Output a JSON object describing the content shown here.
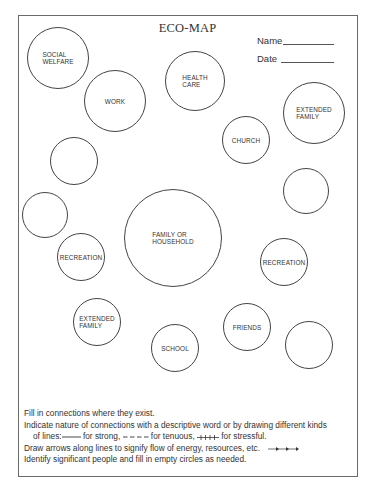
{
  "document": {
    "title": "ECO-MAP",
    "fields": {
      "name_label": "Name",
      "date_label": "Date"
    }
  },
  "circles": [
    {
      "id": "social-welfare",
      "label": "SOCIAL\nWELFARE",
      "cx": 58,
      "cy": 58,
      "r": 31
    },
    {
      "id": "work",
      "label": "WORK",
      "cx": 115,
      "cy": 101,
      "r": 31
    },
    {
      "id": "health-care",
      "label": "HEALTH\nCARE",
      "cx": 195,
      "cy": 81,
      "r": 30
    },
    {
      "id": "extended-family-top",
      "label": "EXTENDED\nFAMILY",
      "cx": 314,
      "cy": 113,
      "r": 31
    },
    {
      "id": "church",
      "label": "CHURCH",
      "cx": 246,
      "cy": 140,
      "r": 24
    },
    {
      "id": "empty-1",
      "label": "",
      "cx": 74,
      "cy": 161,
      "r": 24
    },
    {
      "id": "empty-2",
      "label": "",
      "cx": 306,
      "cy": 191,
      "r": 23
    },
    {
      "id": "empty-3",
      "label": "",
      "cx": 45,
      "cy": 215,
      "r": 23
    },
    {
      "id": "family-or-household",
      "label": "FAMILY OR\nHOUSEHOLD",
      "cx": 173,
      "cy": 238,
      "r": 49
    },
    {
      "id": "recreation-left",
      "label": "RECREATION",
      "cx": 81,
      "cy": 257,
      "r": 24
    },
    {
      "id": "recreation-right",
      "label": "RECREATION",
      "cx": 284,
      "cy": 262,
      "r": 24
    },
    {
      "id": "extended-family-bottom",
      "label": "EXTENDED\nFAMILY",
      "cx": 97,
      "cy": 322,
      "r": 24
    },
    {
      "id": "friends",
      "label": "FRIENDS",
      "cx": 247,
      "cy": 327,
      "r": 24
    },
    {
      "id": "school",
      "label": "SCHOOL",
      "cx": 175,
      "cy": 348,
      "r": 24
    },
    {
      "id": "empty-4",
      "label": "",
      "cx": 309,
      "cy": 345,
      "r": 24
    }
  ],
  "instructions": {
    "line1": "Fill in connections where they exist.",
    "line2": "Indicate nature of connections with a descriptive word or by drawing different kinds",
    "line3_prefix": "of lines:",
    "line3_strong": " for strong, ",
    "line3_tenuous": " for tenuous, ",
    "line3_stressful": " for stressful.",
    "line4": "Draw arrows along lines to signify flow of energy, resources, etc.",
    "line5": "Identify significant people and fill in empty circles as needed."
  },
  "colors": {
    "ink": "#333333",
    "frame": "#6a6a6a",
    "paper": "#ffffff"
  }
}
